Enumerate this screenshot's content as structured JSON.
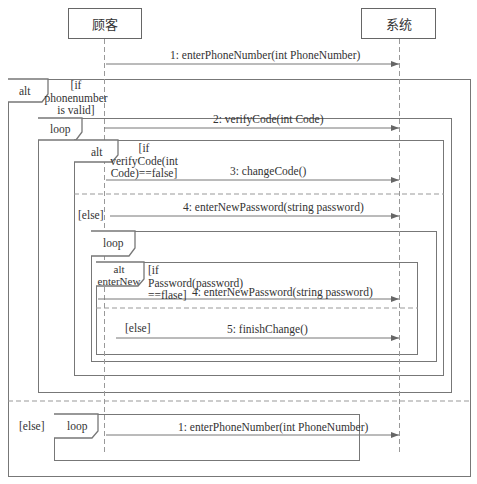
{
  "lifelines": [
    {
      "name": "顾客",
      "x": 104
    },
    {
      "name": "系统",
      "x": 399
    }
  ],
  "messages": [
    {
      "id": "m1",
      "label": "1: enterPhoneNumber(int PhoneNumber)",
      "y": 64
    },
    {
      "id": "m2",
      "label": "2: verifyCode(int Code)",
      "y": 128
    },
    {
      "id": "m3",
      "label": "3: changeCode()",
      "y": 180
    },
    {
      "id": "m4",
      "label": "4: enterNewPassword(string password)",
      "y": 216
    },
    {
      "id": "m5",
      "label": "4: enterNewPassword(string password)",
      "y": 299
    },
    {
      "id": "m6",
      "label": "5: finishChange()",
      "y": 338
    },
    {
      "id": "m7",
      "label": "1: enterPhoneNumber(int PhoneNumber)",
      "y": 435
    }
  ],
  "fragments": {
    "outer_alt": {
      "operator": "alt",
      "guard": "[if\nphonenumber\nis valid]",
      "else_guard": "[else]"
    },
    "loop1": {
      "operator": "loop"
    },
    "alt_verify": {
      "operator": "alt",
      "guard": "[if\nverifyCode(int\nCode)==false]",
      "else_guard": "[else]"
    },
    "loop2": {
      "operator": "loop"
    },
    "alt_enternew": {
      "operator": "alt\nenterNew",
      "guard": "[if\nPassword(password)\n==flase]",
      "else_guard": "[else]"
    },
    "loop3": {
      "operator": "loop"
    }
  },
  "colors": {
    "line": "#777777",
    "text": "#333333",
    "dash": "#999999"
  }
}
